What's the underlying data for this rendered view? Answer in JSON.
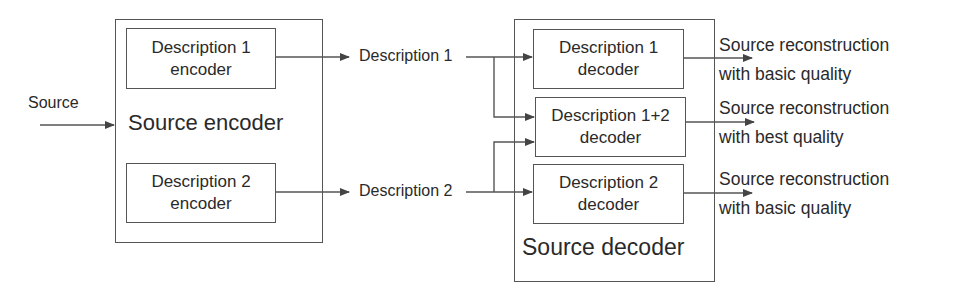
{
  "diagram": {
    "input": {
      "label": "Source"
    },
    "encoder": {
      "label": "Source encoder",
      "blocks": [
        {
          "line1": "Description 1",
          "line2": "encoder"
        },
        {
          "line1": "Description 2",
          "line2": "encoder"
        }
      ]
    },
    "channels": [
      {
        "label": "Description 1"
      },
      {
        "label": "Description 2"
      }
    ],
    "decoder": {
      "label": "Source decoder",
      "blocks": [
        {
          "line1": "Description 1",
          "line2": "decoder"
        },
        {
          "line1": "Description 1+2",
          "line2": "decoder"
        },
        {
          "line1": "Description 2",
          "line2": "decoder"
        }
      ]
    },
    "outputs": [
      {
        "line1": "Source reconstruction",
        "line2": "with basic quality"
      },
      {
        "line1": "Source reconstruction",
        "line2": "with best quality"
      },
      {
        "line1": "Source reconstruction",
        "line2": "with basic quality"
      }
    ],
    "colors": {
      "line": "#555555",
      "text": "#2a2a2a",
      "background": "#ffffff"
    }
  }
}
